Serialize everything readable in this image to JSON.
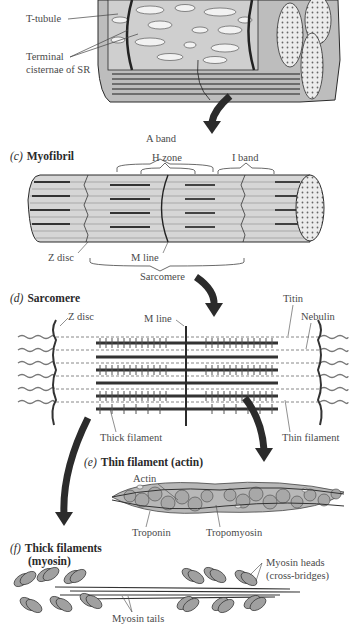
{
  "panels": {
    "b": {
      "labels": {
        "t_tubule": "T-tubule",
        "terminal_cisternae_line1": "Terminal",
        "terminal_cisternae_line2": "cisternae of SR"
      }
    },
    "c": {
      "letter": "(c)",
      "title": "Myofibril",
      "labels": {
        "a_band": "A band",
        "h_zone": "H zone",
        "i_band": "I band",
        "z_disc": "Z disc",
        "m_line": "M line",
        "sarcomere": "Sarcomere"
      }
    },
    "d": {
      "letter": "(d)",
      "title": "Sarcomere",
      "labels": {
        "z_disc": "Z disc",
        "m_line": "M line",
        "titin": "Titin",
        "nebulin": "Nebulin",
        "thick_filament": "Thick filament",
        "thin_filament": "Thin filament"
      }
    },
    "e": {
      "letter": "(e)",
      "title": "Thin filament (actin)",
      "labels": {
        "actin": "Actin",
        "troponin": "Troponin",
        "tropomyosin": "Tropomyosin"
      }
    },
    "f": {
      "letter": "(f)",
      "title_line1": "Thick filaments",
      "title_line2": "(myosin)",
      "labels": {
        "myosin_heads_line1": "Myosin heads",
        "myosin_heads_line2": "(cross-bridges)",
        "myosin_tails": "Myosin tails"
      }
    }
  },
  "colors": {
    "ink": "#2b2b2b",
    "fill_light": "#d9d9d9",
    "fill_mid": "#9a9a9a",
    "fill_dark": "#555555",
    "paper": "#ffffff"
  }
}
